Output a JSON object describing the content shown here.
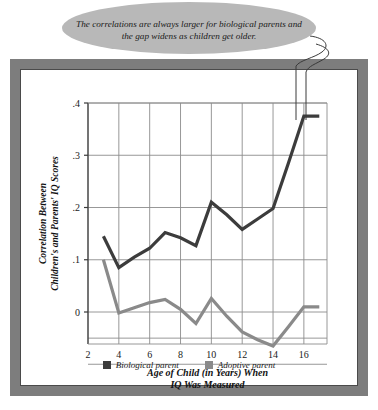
{
  "callout": {
    "text": "The correlations are always larger for biological parents and the gap widens as children get older.",
    "fill_color": "#b8b8b8"
  },
  "frame": {
    "border_color": "#7d7d7d",
    "inner_background": "#ffffff"
  },
  "legend": {
    "items": [
      {
        "label": "Biological parent",
        "color": "#3c3c3c",
        "swatch_name": "legend-swatch-biological"
      },
      {
        "label": "Adoptive parent",
        "color": "#8a8a8a",
        "swatch_name": "legend-swatch-adoptive"
      }
    ]
  },
  "chart_data": {
    "type": "line",
    "title": "",
    "xlabel": "Age of Child (in Years) When IQ Was Measured",
    "ylabel": "Correlation Between Children's and Parents' IQ Scores",
    "xlabel_line1": "Age of Child (in Years) When",
    "xlabel_line2": "IQ Was Measured",
    "ylabel_line1": "Correlation Between",
    "ylabel_line2": "Children's and Parents' IQ Scores",
    "x": [
      3,
      4,
      5,
      6,
      7,
      8,
      9,
      10,
      11,
      12,
      13,
      14,
      15,
      16,
      17
    ],
    "xlim": [
      2,
      17.5
    ],
    "ylim": [
      -0.1,
      0.4
    ],
    "xticks": [
      2,
      4,
      6,
      8,
      10,
      12,
      14,
      16
    ],
    "xticklabels": [
      "2",
      "4",
      "6",
      "8",
      "10",
      "12",
      "14",
      "16"
    ],
    "yticks": [
      0,
      0.1,
      0.2,
      0.3,
      0.4
    ],
    "yticklabels": [
      "0",
      ".1",
      ".2",
      ".3",
      ".4"
    ],
    "grid": true,
    "legend_position": "below",
    "series": [
      {
        "name": "Biological parent",
        "color": "#3c3c3c",
        "values": [
          0.145,
          0.085,
          0.105,
          0.122,
          0.152,
          0.142,
          0.127,
          0.21,
          0.186,
          0.158,
          0.178,
          0.198,
          0.285,
          0.375,
          0.375
        ]
      },
      {
        "name": "Adoptive parent",
        "color": "#8a8a8a",
        "values": [
          0.1,
          -0.002,
          0.008,
          0.018,
          0.024,
          0.005,
          -0.022,
          0.026,
          -0.008,
          -0.038,
          -0.053,
          -0.065,
          -0.028,
          0.01,
          0.01
        ]
      }
    ]
  }
}
